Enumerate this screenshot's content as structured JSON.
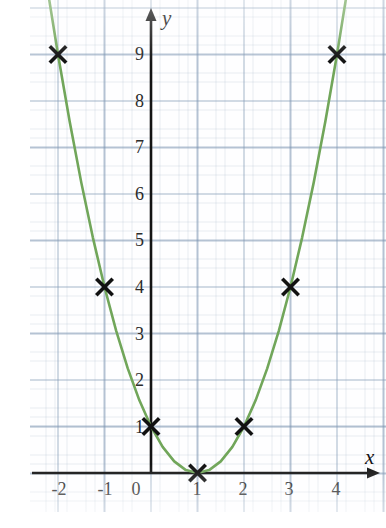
{
  "chart_data": {
    "type": "scatter",
    "title": "",
    "subtitle": "",
    "xlabel": "x",
    "ylabel": "y",
    "xlim": [
      -2.6,
      4.9
    ],
    "ylim": [
      -0.75,
      10.3
    ],
    "grid": true,
    "legend": null,
    "x_ticks": [
      "-2",
      "-1",
      "0",
      "1",
      "2",
      "3",
      "4"
    ],
    "x_tick_values": [
      -2,
      -1,
      0,
      1,
      2,
      3,
      4
    ],
    "y_ticks": [
      "1",
      "2",
      "3",
      "4",
      "5",
      "6",
      "7",
      "8",
      "9"
    ],
    "y_tick_values": [
      1,
      2,
      3,
      4,
      5,
      6,
      7,
      8,
      9
    ],
    "series": [
      {
        "name": "curve",
        "kind": "line",
        "equation": "y = (x - 1)^2",
        "color": "#71a65a",
        "x": [
          -2.22,
          -2.0,
          -1.75,
          -1.5,
          -1.25,
          -1.0,
          -0.75,
          -0.5,
          -0.25,
          0.0,
          0.25,
          0.5,
          0.75,
          1.0,
          1.25,
          1.5,
          1.75,
          2.0,
          2.25,
          2.5,
          2.75,
          3.0,
          3.25,
          3.5,
          3.75,
          4.0,
          4.22
        ],
        "y": [
          10.37,
          9.0,
          7.5625,
          6.25,
          5.0625,
          4.0,
          3.0625,
          2.25,
          1.5625,
          1.0,
          0.5625,
          0.25,
          0.0625,
          0.0,
          0.0625,
          0.25,
          0.5625,
          1.0,
          1.5625,
          2.25,
          3.0625,
          4.0,
          5.0625,
          6.25,
          7.5625,
          9.0,
          10.37
        ]
      },
      {
        "name": "plotted-points",
        "kind": "scatter",
        "marker": "x",
        "color": "#111111",
        "points": [
          {
            "x": -2,
            "y": 9
          },
          {
            "x": -1,
            "y": 4
          },
          {
            "x": 0,
            "y": 1
          },
          {
            "x": 1,
            "y": 0
          },
          {
            "x": 2,
            "y": 1
          },
          {
            "x": 3,
            "y": 4
          },
          {
            "x": 4,
            "y": 9
          }
        ]
      }
    ]
  },
  "axes": {
    "x_axis_label": "x",
    "y_axis_label": "y"
  },
  "colors": {
    "curve": "#71a65a",
    "marker": "#111111",
    "axis": "#141414",
    "grid_major": "#7891af",
    "grid_minor": "#8ca0b9",
    "paper": "#fefeff"
  }
}
